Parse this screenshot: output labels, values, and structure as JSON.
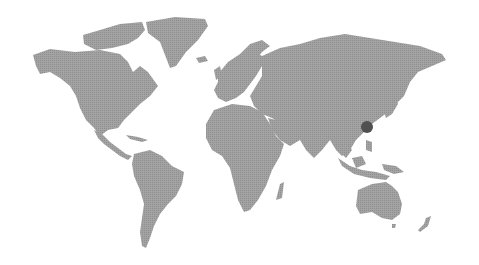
{
  "map": {
    "type": "world-map",
    "land_color": "#9a9a9a",
    "background_color": "#ffffff",
    "marker": {
      "location": "East China (Shanghai region)",
      "x": 367,
      "y": 127,
      "radius": 6,
      "color": "#505050"
    }
  }
}
